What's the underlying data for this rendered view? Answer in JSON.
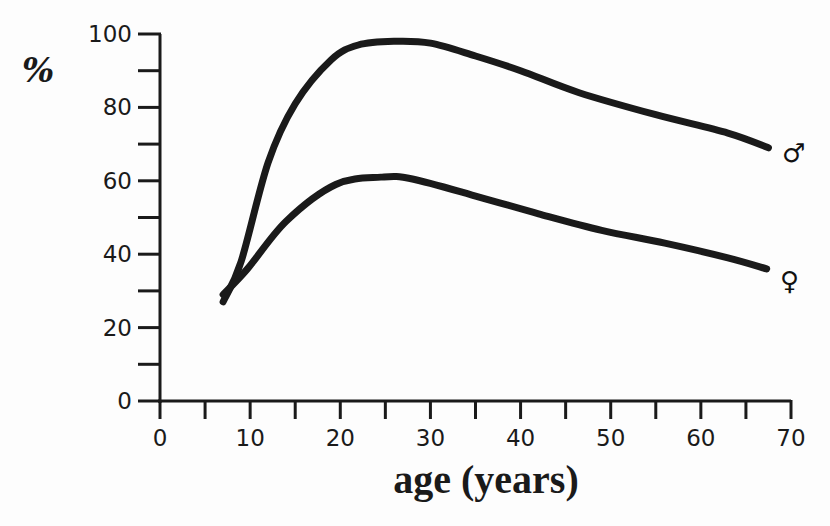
{
  "chart_data": {
    "type": "line",
    "title": "",
    "xlabel": "age (years)",
    "ylabel": "%",
    "xlim": [
      0,
      70
    ],
    "ylim": [
      0,
      100
    ],
    "x_ticks": [
      0,
      10,
      20,
      30,
      40,
      50,
      60,
      70
    ],
    "x_minor_ticks": [
      5,
      15,
      25,
      35,
      45,
      55,
      65
    ],
    "y_ticks": [
      0,
      20,
      40,
      60,
      80,
      100
    ],
    "y_minor_ticks": [
      10,
      30,
      50,
      70,
      90
    ],
    "grid": false,
    "legend": "inline symbols at line ends",
    "series": [
      {
        "name": "male",
        "symbol": "♂",
        "color": "#1a1a1a",
        "points": [
          [
            7,
            27
          ],
          [
            9,
            38
          ],
          [
            12,
            65
          ],
          [
            15,
            81
          ],
          [
            19,
            93
          ],
          [
            22,
            97
          ],
          [
            26,
            98
          ],
          [
            30,
            97.5
          ],
          [
            35,
            94
          ],
          [
            40,
            90
          ],
          [
            46.5,
            84
          ],
          [
            55,
            78
          ],
          [
            63,
            73
          ],
          [
            67.5,
            69
          ]
        ]
      },
      {
        "name": "female",
        "symbol": "♀",
        "color": "#1a1a1a",
        "points": [
          [
            7,
            29
          ],
          [
            9.7,
            36
          ],
          [
            14,
            49
          ],
          [
            19.5,
            59
          ],
          [
            24.5,
            61
          ],
          [
            28,
            60.5
          ],
          [
            35.5,
            55.5
          ],
          [
            42,
            51
          ],
          [
            49,
            46.5
          ],
          [
            56,
            43
          ],
          [
            63,
            39
          ],
          [
            67.3,
            36
          ]
        ]
      }
    ]
  },
  "labels": {
    "y_axis": "%",
    "x_axis": "age (years)",
    "male_symbol": "♂",
    "female_symbol": "♀"
  }
}
